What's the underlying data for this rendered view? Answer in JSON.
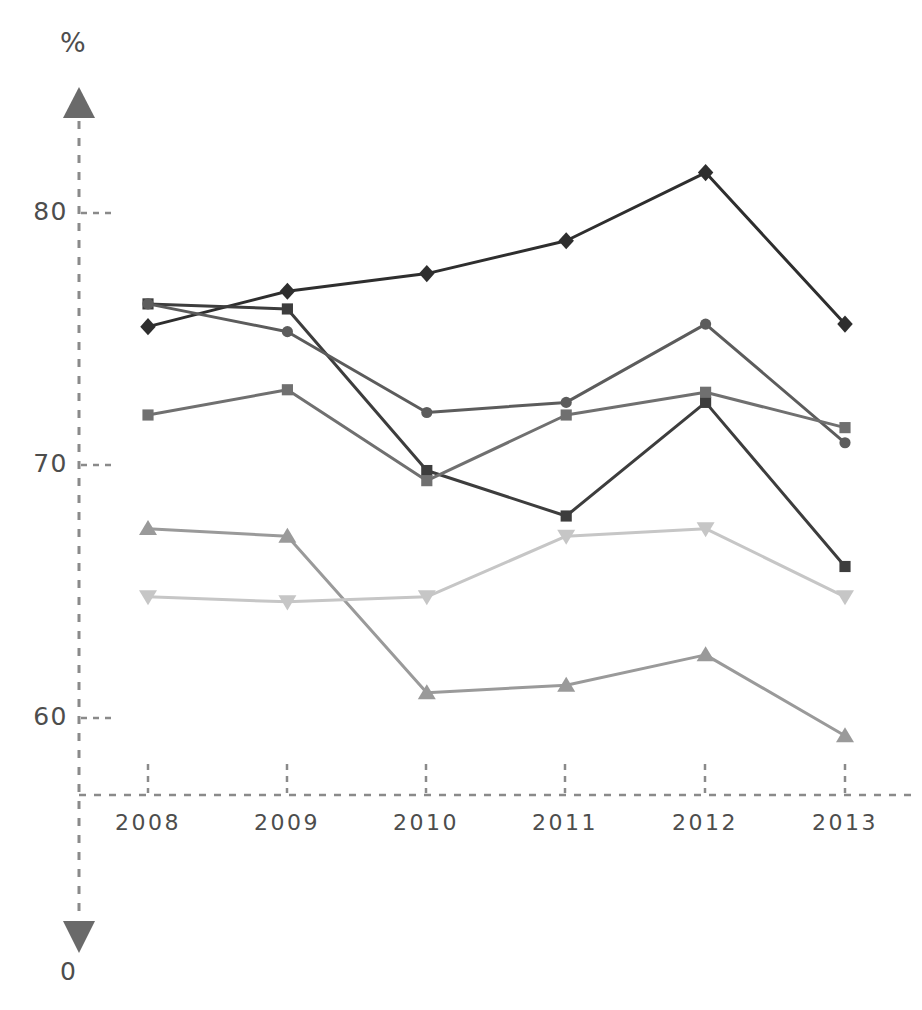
{
  "chart_data": {
    "type": "line",
    "title": "",
    "xlabel": "",
    "ylabel": "%",
    "unit_label": "%",
    "zero_label": "0",
    "categories": [
      "2008",
      "2009",
      "2010",
      "2011",
      "2012",
      "2013"
    ],
    "x": [
      2008,
      2009,
      2010,
      2011,
      2012,
      2013
    ],
    "ylim": [
      57.0,
      83.5
    ],
    "y_ticks": [
      80,
      70,
      60
    ],
    "y_tick_labels": [
      "80",
      "70",
      "60"
    ],
    "grid": false,
    "legend": "none",
    "axis_style": "dashed-with-arrows",
    "series": [
      {
        "name": "series-1-diamond",
        "marker": "diamond",
        "color": "#2e2e2e",
        "values": [
          75.5,
          76.9,
          77.6,
          78.9,
          81.6,
          75.6
        ]
      },
      {
        "name": "series-2-dark-square",
        "marker": "square",
        "color": "#3d3d3d",
        "values": [
          76.4,
          76.2,
          69.8,
          68.0,
          72.5,
          66.0
        ]
      },
      {
        "name": "series-3-circle",
        "marker": "circle",
        "color": "#5c5c5c",
        "values": [
          76.4,
          75.3,
          72.1,
          72.5,
          75.6,
          70.9
        ]
      },
      {
        "name": "series-4-gray-square",
        "marker": "square",
        "color": "#707070",
        "values": [
          72.0,
          73.0,
          69.4,
          72.0,
          72.9,
          71.5
        ]
      },
      {
        "name": "series-5-triangle",
        "marker": "triangle-up",
        "color": "#9a9a9a",
        "values": [
          67.5,
          67.2,
          61.0,
          61.3,
          62.5,
          59.3
        ]
      },
      {
        "name": "series-6-inverted-triangle",
        "marker": "triangle-down",
        "color": "#c6c6c6",
        "values": [
          64.8,
          64.6,
          64.8,
          67.2,
          67.5,
          64.8
        ]
      }
    ]
  },
  "axis": {
    "y_unit": "%",
    "y_zero": "0",
    "y_ticks": [
      "80",
      "70",
      "60"
    ],
    "x_ticks": [
      "2008",
      "2009",
      "2010",
      "2011",
      "2012",
      "2013"
    ],
    "axis_color": "#6e6e6e"
  }
}
